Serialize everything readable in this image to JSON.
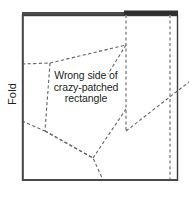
{
  "figure": {
    "background_color": "#ffffff",
    "width": 189,
    "height": 202
  },
  "labels": {
    "fold": "Fold",
    "caption_line1": "Wrong side of",
    "caption_line2": "crazy-patched",
    "caption_line3": "rectangle"
  },
  "colors": {
    "outline": "#3b3b3b",
    "dashed_line": "#6d6d6d",
    "dashed_vertical": "#8a8a8a",
    "top_bar_light": "#4a4a4a",
    "top_bar_dark": "#2e2e2e",
    "text": "#231f20"
  },
  "geometry": {
    "rectangle": {
      "x": 22,
      "y": 15,
      "width": 155,
      "height": 165
    },
    "top_bar": {
      "light_segment": {
        "x1": 22,
        "x2": 125,
        "y": 13,
        "thickness": 3
      },
      "dark_segment": {
        "x1": 125,
        "x2": 178,
        "y": 12,
        "thickness": 5
      }
    },
    "dashed_vertical_lines": [
      {
        "name": "inner-fold-line",
        "x": 126,
        "y1": 15,
        "y2": 131
      },
      {
        "name": "outer-fold-line",
        "x": 170,
        "y1": 15,
        "y2": 180
      }
    ],
    "dashed_seam_paths": [
      {
        "name": "upper-left-seam",
        "points": "22,64 50,63 126,45"
      },
      {
        "name": "patch-left-edge",
        "points": "50,63 44,132"
      },
      {
        "name": "patch-lower-edge",
        "points": "44,132 92,158"
      },
      {
        "name": "left-border-to-crossing",
        "points": "22,122 44,132"
      },
      {
        "name": "crossing-to-bottom",
        "points": "44,132 92,158 103,180"
      },
      {
        "name": "patch-right-diagonal",
        "points": "92,158 126,108"
      },
      {
        "name": "seam-to-corner",
        "points": "126,45 110,72"
      },
      {
        "name": "right-long-diagonal",
        "points": "126,131 189,83"
      }
    ]
  }
}
